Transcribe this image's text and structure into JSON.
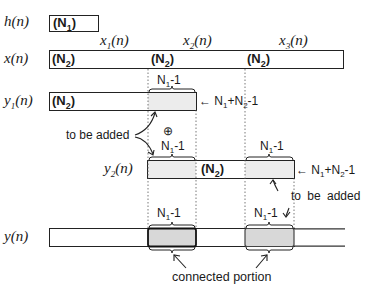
{
  "rows": {
    "h": {
      "label": "h(n)",
      "segment": "(N1)"
    },
    "x": {
      "label": "x(n)",
      "segments": [
        "(N2)",
        "(N2)",
        "(N2)"
      ],
      "block_labels": [
        "x1(n)",
        "x2(n)",
        "x3(n)"
      ]
    },
    "y1": {
      "label": "y1(n)",
      "segment": "(N2)",
      "overlap_label": "N1-1",
      "length_label": "N1+N2-1"
    },
    "y2": {
      "label": "y2(n)",
      "segment": "(N2)",
      "overlap_label_left": "N1-1",
      "overlap_label_right": "N1-1",
      "length_label": "N1+N2-1"
    },
    "y": {
      "label": "y(n)",
      "overlap_label_left": "N1-1",
      "overlap_label_right": "N1-1"
    }
  },
  "annotations": {
    "to_be_added_1": "to be added",
    "to_be_added_2": "to be added",
    "plus_symbol": "⊕",
    "connected_portion": "connected portion",
    "arrow_left": "←"
  },
  "colors": {
    "stroke": "#222222",
    "shade": "#d8d8d8",
    "shade_light": "#ececec"
  }
}
